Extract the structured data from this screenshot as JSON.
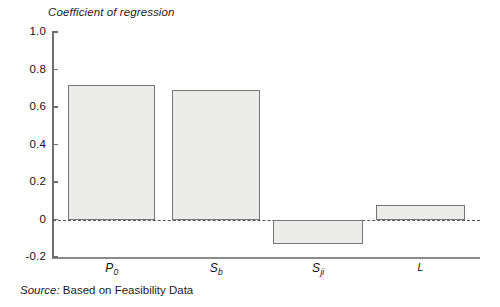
{
  "chart_data": {
    "type": "bar",
    "title": "Coefficient of regression",
    "xlabel": "",
    "ylabel": "Coefficient of regression",
    "categories": [
      "P0",
      "Sb",
      "Sji",
      "L"
    ],
    "category_labels": [
      {
        "base": "P",
        "sub": "0"
      },
      {
        "base": "S",
        "sub": "b"
      },
      {
        "base": "S",
        "sub": "ji"
      },
      {
        "base": "L",
        "sub": ""
      }
    ],
    "values": [
      0.715,
      0.69,
      -0.13,
      0.08
    ],
    "ylim": [
      -0.2,
      1.0
    ],
    "yticks": [
      1.0,
      0.8,
      0.6,
      0.4,
      0.2,
      0.0,
      -0.2
    ],
    "ytick_labels": [
      "1.0",
      "0.8",
      "0.6",
      "0.4",
      "0.2",
      "0",
      "-0.2"
    ],
    "grid": false,
    "legend": "none",
    "zero_reference_line": true,
    "bar_fill_color": "#ececea",
    "bar_border_color": "#767676",
    "axis_color": "#6f6f6f"
  },
  "source": {
    "label": "Source:",
    "text": "Based on Feasibility Data"
  }
}
